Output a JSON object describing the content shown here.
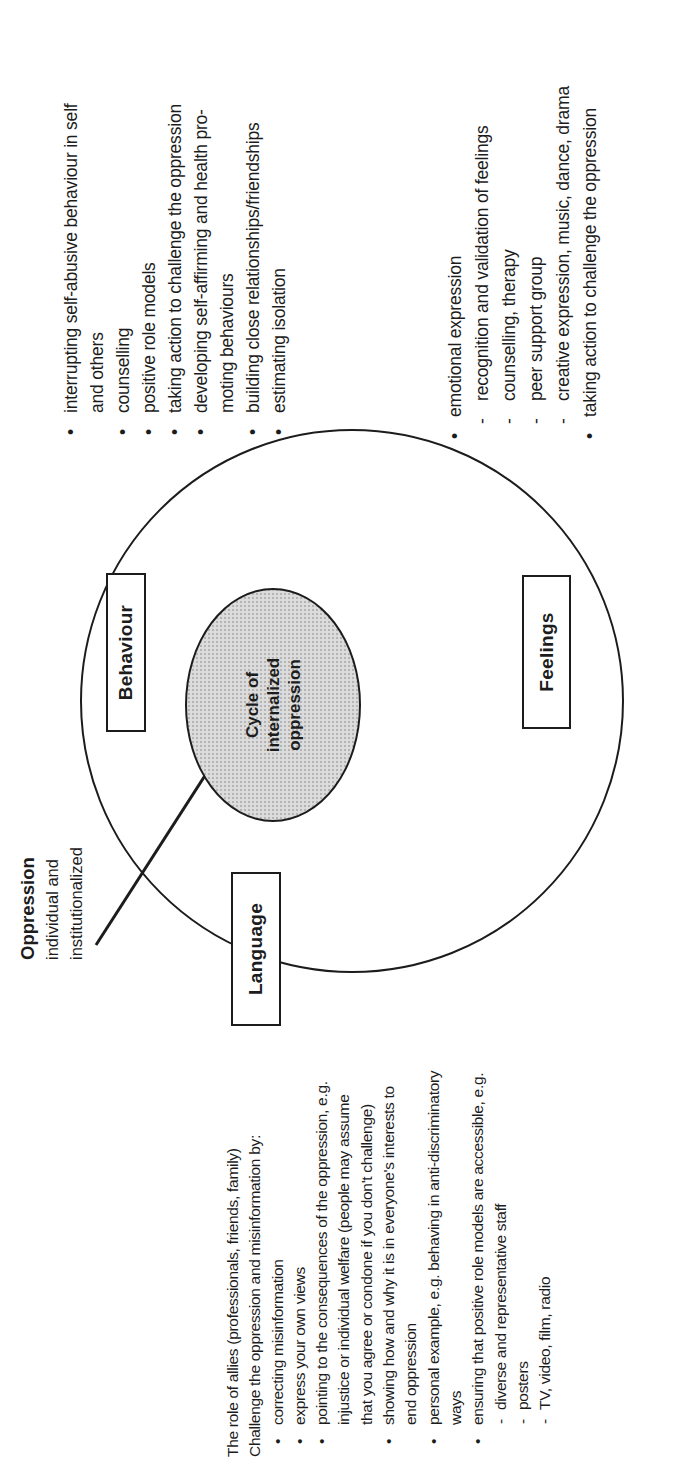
{
  "colors": {
    "page_bg": "#ffffff",
    "ink": "#1c1c1c",
    "ellipse_fill": "#dcdcdc",
    "ellipse_dot": "#b4b4b4"
  },
  "diagram": {
    "center": {
      "lines": [
        "Cycle of",
        "internalized",
        "oppression"
      ]
    },
    "nodes": [
      {
        "label": "Behaviour"
      },
      {
        "label": "Feelings"
      },
      {
        "label": "Language"
      }
    ],
    "oppression": {
      "title": "Oppression",
      "line2": "individual and",
      "line3": "institutionalized"
    }
  },
  "behaviour_list": {
    "items": [
      {
        "marker": "•",
        "indent": 1,
        "text": "interrupting self-abusive behaviour in self"
      },
      {
        "marker": "",
        "indent": 1,
        "text": "and others"
      },
      {
        "marker": "•",
        "indent": 1,
        "text": "counselling"
      },
      {
        "marker": "•",
        "indent": 1,
        "text": "positive role models"
      },
      {
        "marker": "•",
        "indent": 1,
        "text": "taking action to challenge the oppression"
      },
      {
        "marker": "•",
        "indent": 1,
        "text": "developing self-affirming and health pro-"
      },
      {
        "marker": "",
        "indent": 1,
        "text": "moting behaviours"
      },
      {
        "marker": "•",
        "indent": 1,
        "text": "building close relationships/friendships"
      },
      {
        "marker": "•",
        "indent": 1,
        "text": "estimating isolation"
      }
    ]
  },
  "feelings_list": {
    "items": [
      {
        "marker": "•",
        "indent": 1,
        "text": "emotional expression"
      },
      {
        "marker": "-",
        "indent": 2,
        "text": "recognition and validation of feelings"
      },
      {
        "marker": "-",
        "indent": 2,
        "text": "counselling, therapy"
      },
      {
        "marker": "-",
        "indent": 2,
        "text": "peer support group"
      },
      {
        "marker": "-",
        "indent": 2,
        "text": "creative expression, music, dance, drama"
      },
      {
        "marker": "•",
        "indent": 1,
        "text": "taking action to challenge the oppression"
      }
    ]
  },
  "allies_block": {
    "items": [
      {
        "marker": "",
        "indent": 0,
        "text": "The role of allies (professionals, friends, family)"
      },
      {
        "marker": "",
        "indent": 0,
        "text": "Challenge the oppression and misinformation by:"
      },
      {
        "marker": "•",
        "indent": 1,
        "text": "correcting misinformation"
      },
      {
        "marker": "•",
        "indent": 1,
        "text": "express your own views"
      },
      {
        "marker": "•",
        "indent": 1,
        "text": "pointing to the consequences of the oppression, e.g."
      },
      {
        "marker": "",
        "indent": 1,
        "text": "injustice or individual welfare (people may assume"
      },
      {
        "marker": "",
        "indent": 1,
        "text": "that you agree or condone if you don't challenge)"
      },
      {
        "marker": "•",
        "indent": 1,
        "text": "showing how and why it is in everyone's interests to"
      },
      {
        "marker": "",
        "indent": 1,
        "text": "end oppression"
      },
      {
        "marker": "•",
        "indent": 1,
        "text": "personal example, e.g. behaving in anti-discriminatory"
      },
      {
        "marker": "",
        "indent": 1,
        "text": "ways"
      },
      {
        "marker": "•",
        "indent": 1,
        "text": "ensuring that positive role models are accessible, e.g."
      },
      {
        "marker": "-",
        "indent": 2,
        "text": "diverse and representative staff"
      },
      {
        "marker": "-",
        "indent": 2,
        "text": "posters"
      },
      {
        "marker": "-",
        "indent": 2,
        "text": "TV, video, film, radio"
      }
    ]
  }
}
